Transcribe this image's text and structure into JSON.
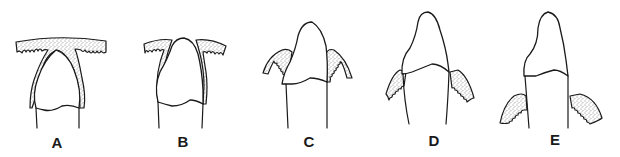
{
  "figure": {
    "panels": [
      {
        "label": "A",
        "stage": "crown beneath continuous epithelial covering"
      },
      {
        "label": "B",
        "stage": "crown tip piercing epithelium"
      },
      {
        "label": "C",
        "stage": "crown emerged, tissue cuffs at crown base"
      },
      {
        "label": "D",
        "stage": "tissue cuffs at cemento-enamel junction"
      },
      {
        "label": "E",
        "stage": "tissue cuffs below cemento-enamel junction on root"
      }
    ],
    "colors": {
      "line": "#1a1a1a",
      "background": "#ffffff",
      "stipple": "#1a1a1a"
    }
  }
}
